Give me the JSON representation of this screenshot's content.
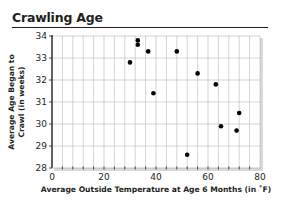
{
  "chart_data": {
    "type": "scatter",
    "title": "Crawling Age",
    "xlabel": "Average Outside Temperature at Age 6 Months (in ˚F)",
    "ylabel": "Average Age Began to Crawl (in weeks)",
    "ylabel_lines": [
      "Average Age Began to",
      "Crawl (in weeks)"
    ],
    "xlim": [
      0,
      80
    ],
    "ylim": [
      28,
      34
    ],
    "x_ticks": [
      0,
      20,
      40,
      60,
      80
    ],
    "y_ticks": [
      28,
      29,
      30,
      31,
      32,
      33,
      34
    ],
    "grid": true,
    "legend": null,
    "points": [
      {
        "x": 30,
        "y": 32.8
      },
      {
        "x": 33,
        "y": 33.8
      },
      {
        "x": 33,
        "y": 33.6
      },
      {
        "x": 37,
        "y": 33.3
      },
      {
        "x": 39,
        "y": 31.4
      },
      {
        "x": 48,
        "y": 33.3
      },
      {
        "x": 52,
        "y": 28.6
      },
      {
        "x": 56,
        "y": 32.3
      },
      {
        "x": 63,
        "y": 31.8
      },
      {
        "x": 65,
        "y": 29.9
      },
      {
        "x": 71,
        "y": 29.7
      },
      {
        "x": 72,
        "y": 30.5
      }
    ]
  },
  "colors": {
    "text": "#231f20",
    "grid": "#b7b7b7",
    "point": "#000000",
    "axis": "#231f20",
    "shadow": "#d9d9d9"
  }
}
